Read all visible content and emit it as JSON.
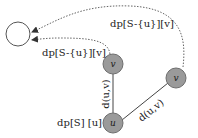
{
  "diagram": {
    "colors": {
      "node_fill": "#9a9a9a",
      "node_stroke": "#6e6e6e",
      "target_fill": "#ffffff",
      "target_stroke": "#555555",
      "edge": "#555555",
      "dotted": "#666666",
      "text": "#222222"
    },
    "nodes": {
      "target": {
        "label": ""
      },
      "v_mid": {
        "label": "v"
      },
      "v_right": {
        "label": "v"
      },
      "u": {
        "label": "u"
      }
    },
    "labels": {
      "dp_top": "dp[S-{u}][v]",
      "dp_left": "dp[S-{u}][v]",
      "edge_vertical": "d(u,v)",
      "edge_diagonal": "d(u,v)",
      "dp_u": "dp[S] [u]"
    }
  }
}
